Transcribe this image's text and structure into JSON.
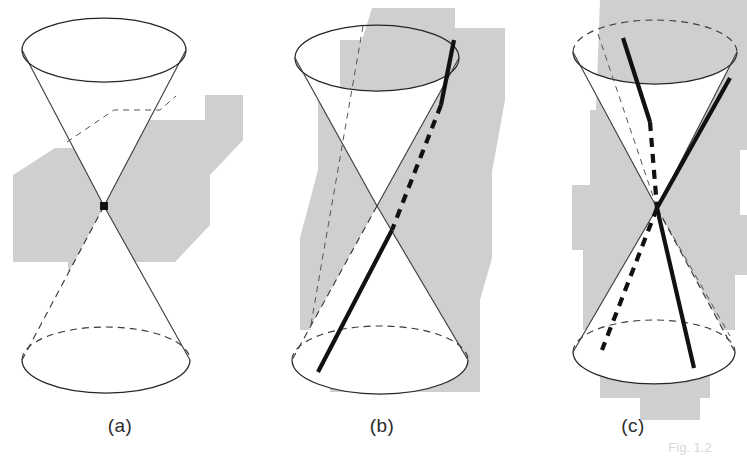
{
  "figure": {
    "background_color": "#ffffff",
    "shadow_color": "#cfcfcf",
    "line_color": "#262626",
    "highlight_color": "#111111",
    "panels": [
      {
        "id": "a",
        "label": "(a)",
        "label_x": 120,
        "label_y": 432,
        "description": "double cone with vertex point, plane through vertex yields a point",
        "apex": {
          "x": 104,
          "y": 206
        },
        "top_ellipse": {
          "cx": 104,
          "cy": 50,
          "rx": 82,
          "ry": 32
        },
        "bottom_ellipse": {
          "cx": 106,
          "cy": 360,
          "rx": 84,
          "ry": 33
        },
        "conic_kind": "point",
        "marker": {
          "x": 104,
          "y": 206,
          "size": 7,
          "color": "#111111"
        }
      },
      {
        "id": "b",
        "label": "(b)",
        "label_x": 382,
        "label_y": 432,
        "description": "plane cutting one nappe parallel to a generator yields a parabola",
        "apex": {
          "x": 377,
          "y": 206
        },
        "top_ellipse": {
          "cx": 377,
          "cy": 58,
          "rx": 82,
          "ry": 33
        },
        "bottom_ellipse": {
          "cx": 380,
          "cy": 360,
          "rx": 88,
          "ry": 34
        },
        "conic_kind": "parabola"
      },
      {
        "id": "c",
        "label": "(c)",
        "label_x": 633,
        "label_y": 432,
        "description": "plane cutting both nappes yields a hyperbola with two branches",
        "apex": {
          "x": 657,
          "y": 208
        },
        "top_ellipse": {
          "cx": 655,
          "cy": 52,
          "rx": 82,
          "ry": 32
        },
        "bottom_ellipse": {
          "cx": 654,
          "cy": 352,
          "rx": 81,
          "ry": 32
        },
        "conic_kind": "hyperbola"
      }
    ],
    "caption": "Fig. 1.2"
  }
}
